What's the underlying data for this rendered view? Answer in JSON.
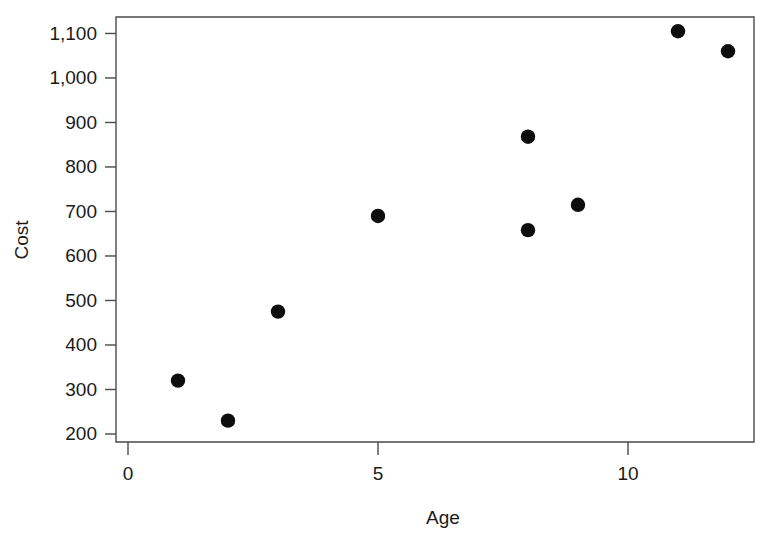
{
  "chart_data": {
    "type": "scatter",
    "title": "",
    "xlabel": "Age",
    "ylabel": "Cost",
    "x": [
      1,
      2,
      3,
      5,
      8,
      8,
      9,
      11,
      12
    ],
    "values": [
      320,
      230,
      475,
      690,
      868,
      658,
      715,
      1105,
      1060
    ],
    "points": [
      {
        "x": 1,
        "y": 320
      },
      {
        "x": 2,
        "y": 230
      },
      {
        "x": 3,
        "y": 475
      },
      {
        "x": 5,
        "y": 690
      },
      {
        "x": 8,
        "y": 868
      },
      {
        "x": 8,
        "y": 658
      },
      {
        "x": 9,
        "y": 715
      },
      {
        "x": 11,
        "y": 1105
      },
      {
        "x": 12,
        "y": 1060
      }
    ],
    "xlim": [
      -0.24,
      12.52
    ],
    "ylim": [
      182,
      1137
    ],
    "xticks": [
      0,
      5,
      10
    ],
    "xticklabels": [
      "0",
      "5",
      "10"
    ],
    "yticks": [
      200,
      300,
      400,
      500,
      600,
      700,
      800,
      900,
      1000,
      1100
    ],
    "yticklabels": [
      "200",
      "300",
      "400",
      "500",
      "600",
      "700",
      "800",
      "900",
      "1,000",
      "1,100"
    ],
    "grid": false,
    "legend": null,
    "marker": "filled-circle",
    "marker_color": "#0d0d0d",
    "frame_color": "#4a4a4a",
    "background": "#ffffff"
  }
}
